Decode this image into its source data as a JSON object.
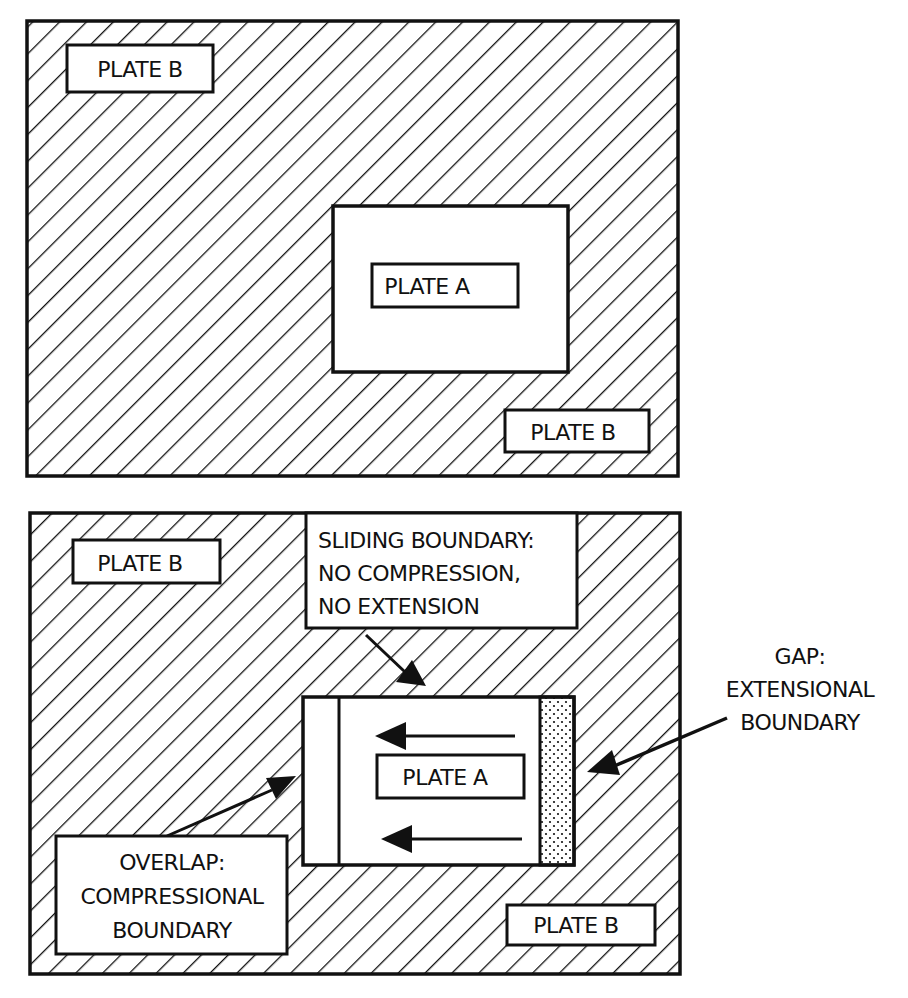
{
  "figure": {
    "top_panel": {
      "outer_plate_label_1": "PLATE B",
      "outer_plate_label_2": "PLATE B",
      "inner_plate_label": "PLATE A"
    },
    "bottom_panel": {
      "outer_plate_label_1": "PLATE B",
      "outer_plate_label_2": "PLATE B",
      "inner_plate_label": "PLATE A",
      "sliding_boundary": {
        "lines": [
          "SLIDING BOUNDARY:",
          "NO COMPRESSION,",
          "NO EXTENSION"
        ]
      },
      "gap_boundary": {
        "lines": [
          "GAP:",
          "EXTENSIONAL",
          "BOUNDARY"
        ]
      },
      "overlap_boundary": {
        "lines": [
          "OVERLAP:",
          "COMPRESSIONAL",
          "BOUNDARY"
        ]
      },
      "motion_direction": "left"
    },
    "colors": {
      "ink": "#111111",
      "background": "#ffffff"
    }
  }
}
